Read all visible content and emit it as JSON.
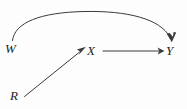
{
  "diagram": {
    "type": "causal-dag",
    "title": "",
    "background_color": "#fdfdfd",
    "stroke_color": "#3a3a3a",
    "text_color": "#1d1d1d",
    "nodes": [
      {
        "id": "W",
        "label": "W",
        "x": 11,
        "y": 48
      },
      {
        "id": "X",
        "label": "X",
        "x": 93,
        "y": 51
      },
      {
        "id": "Y",
        "label": "Y",
        "x": 171,
        "y": 50
      },
      {
        "id": "R",
        "label": "R",
        "x": 16,
        "y": 96
      }
    ],
    "edges": [
      {
        "id": "w-to-y",
        "from": "W",
        "to": "Y",
        "style": "curved-arc",
        "direction": "directed"
      },
      {
        "id": "x-to-y",
        "from": "X",
        "to": "Y",
        "style": "straight",
        "direction": "directed"
      },
      {
        "id": "r-to-x",
        "from": "R",
        "to": "X",
        "style": "straight-diagonal",
        "direction": "directed"
      }
    ]
  }
}
